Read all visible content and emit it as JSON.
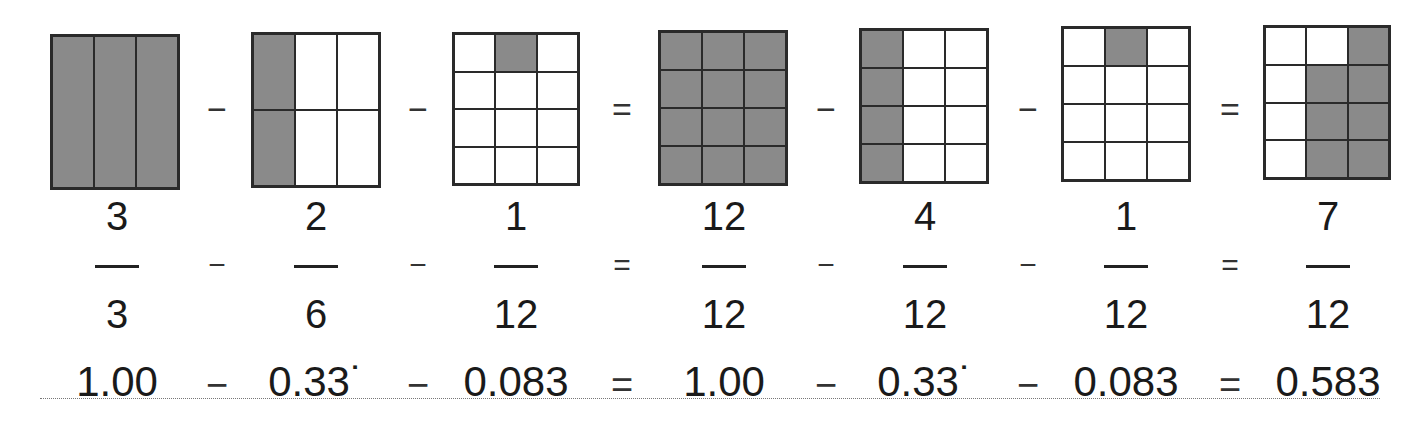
{
  "models": [
    {
      "x": 50,
      "y": 34,
      "w": 130,
      "h": 156,
      "cols": 3,
      "rows": 1,
      "shaded": [
        0,
        1,
        2
      ]
    },
    {
      "x": 251,
      "y": 32,
      "w": 130,
      "h": 156,
      "cols": 3,
      "rows": 2,
      "shaded": [
        0,
        3
      ]
    },
    {
      "x": 452,
      "y": 32,
      "w": 128,
      "h": 154,
      "cols": 3,
      "rows": 4,
      "shaded": [
        1
      ]
    },
    {
      "x": 658,
      "y": 30,
      "w": 130,
      "h": 156,
      "cols": 3,
      "rows": 4,
      "shaded": [
        0,
        1,
        2,
        3,
        4,
        5,
        6,
        7,
        8,
        9,
        10,
        11
      ]
    },
    {
      "x": 859,
      "y": 28,
      "w": 130,
      "h": 156,
      "cols": 3,
      "rows": 4,
      "shaded": [
        0,
        3,
        6,
        9
      ]
    },
    {
      "x": 1061,
      "y": 26,
      "w": 130,
      "h": 156,
      "cols": 3,
      "rows": 4,
      "shaded": [
        1
      ]
    },
    {
      "x": 1263,
      "y": 25,
      "w": 128,
      "h": 155,
      "cols": 3,
      "rows": 4,
      "shaded": [
        2,
        4,
        5,
        7,
        8,
        10,
        11
      ]
    }
  ],
  "fractions": [
    {
      "num": "3",
      "den": "3",
      "decimal": "1.00",
      "cx": 117
    },
    {
      "num": "2",
      "den": "6",
      "decimal": "0.33˙",
      "cx": 316
    },
    {
      "num": "1",
      "den": "12",
      "decimal": "0.083",
      "cx": 516
    },
    {
      "num": "12",
      "den": "12",
      "decimal": "1.00",
      "cx": 724
    },
    {
      "num": "4",
      "den": "12",
      "decimal": "0.33˙",
      "cx": 925
    },
    {
      "num": "1",
      "den": "12",
      "decimal": "0.083",
      "cx": 1126
    },
    {
      "num": "7",
      "den": "12",
      "decimal": "0.583",
      "cx": 1328
    }
  ],
  "operators": [
    {
      "sym": "−",
      "cx": 217
    },
    {
      "sym": "−",
      "cx": 418
    },
    {
      "sym": "=",
      "cx": 622
    },
    {
      "sym": "−",
      "cx": 826
    },
    {
      "sym": "−",
      "cx": 1028
    },
    {
      "sym": "=",
      "cx": 1230
    }
  ]
}
